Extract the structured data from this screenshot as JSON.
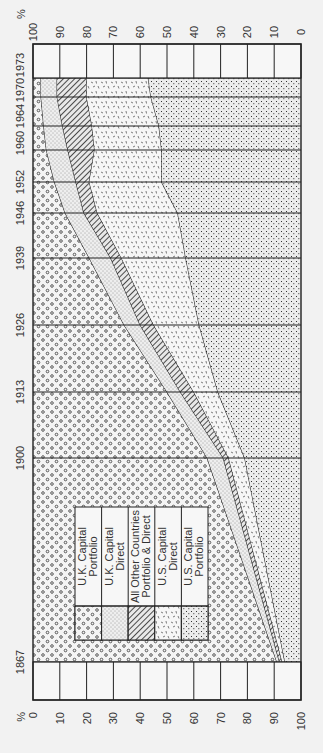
{
  "chart_data": {
    "type": "area",
    "orientation": "rotated-90",
    "title": "",
    "xlabel": "Year",
    "ylabel": "%",
    "percent_symbol": "%",
    "ylim": [
      0,
      100
    ],
    "axis_ticks": [
      "0",
      "10",
      "20",
      "30",
      "40",
      "50",
      "60",
      "70",
      "80",
      "90",
      "100"
    ],
    "categories": [
      "1867",
      "1900",
      "1913",
      "1926",
      "1939",
      "1946",
      "1952",
      "1960",
      "1964",
      "1970",
      "1973"
    ],
    "series": [
      {
        "name": "U.K. Capital Portfolio",
        "pattern": "circles",
        "values": [
          91,
          65,
          50,
          34,
          21,
          12,
          8,
          5,
          4,
          3,
          3
        ]
      },
      {
        "name": "U.K. Capital Direct",
        "pattern": "fine-dots",
        "values": [
          1,
          6,
          5,
          6,
          8,
          7,
          8,
          8,
          7,
          6,
          6
        ]
      },
      {
        "name": "All Other Countries Portfolio & Direct",
        "pattern": "diagonal-hatch",
        "values": [
          1,
          2,
          5,
          5,
          4,
          5,
          5,
          10,
          11,
          11,
          11
        ]
      },
      {
        "name": "U.S. Capital Direct",
        "pattern": "dashes",
        "values": [
          1,
          6,
          9,
          17,
          24,
          30,
          27,
          25,
          25,
          24,
          23
        ]
      },
      {
        "name": "U.S. Capital Portfolio",
        "pattern": "coarse-dots",
        "values": [
          6,
          21,
          31,
          38,
          43,
          46,
          52,
          52,
          53,
          56,
          57
        ]
      }
    ],
    "legend": {
      "position": "inside-lower-left",
      "entries": [
        "U.K. Capital Portfolio",
        "U.K. Capital Direct",
        "All Other Countries Portfolio & Direct",
        "U.S. Capital Direct",
        "U.S. Capital Portfolio"
      ]
    },
    "stacked": true,
    "grid": true
  },
  "legend_lines": [
    [
      "U.K. Capital",
      "Portfolio"
    ],
    [
      "U.K. Capital",
      "Direct"
    ],
    [
      "All Other Countries",
      "Portfolio & Direct"
    ],
    [
      "U.S. Capital",
      "Direct"
    ],
    [
      "U.S. Capital",
      "Portfolio"
    ]
  ],
  "colors": {
    "ink": "#222222",
    "background": "#f2f2f2"
  }
}
